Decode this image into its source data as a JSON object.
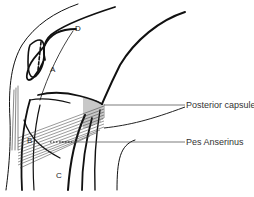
{
  "figure": {
    "type": "anatomical line drawing",
    "letters": {
      "A": "A",
      "B": "B",
      "C": "C",
      "D": "D"
    },
    "callouts": [
      {
        "label": "Posterior capsule"
      },
      {
        "label": "Pes Anserinus"
      }
    ],
    "colors": {
      "line": "#111111",
      "leader": "#444444",
      "text": "#333333",
      "background": "#ffffff"
    }
  }
}
